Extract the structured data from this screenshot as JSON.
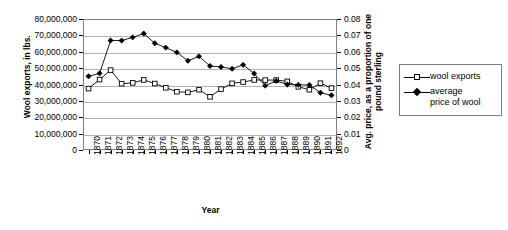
{
  "chart_data": {
    "type": "line",
    "title": "",
    "xlabel": "Year",
    "ylabel": "Wool exports, in lbs.",
    "ylabel_secondary": "Avg. price, as a proportion of one pound sterling",
    "grid": true,
    "legend_position": "right",
    "categories": [
      "1870",
      "1871",
      "1872",
      "1873",
      "1874",
      "1875",
      "1876",
      "1877",
      "1878",
      "1879",
      "1880",
      "1881",
      "1882",
      "1883",
      "1884",
      "1885",
      "1886",
      "1887",
      "1888",
      "1889",
      "1890",
      "1891",
      "1892"
    ],
    "ylim": [
      0,
      80000000
    ],
    "yticks": [
      "0",
      "10,000,000",
      "20,000,000",
      "30,000,000",
      "40,000,000",
      "50,000,000",
      "60,000,000",
      "70,000,000",
      "80,000,000"
    ],
    "ytick_values": [
      0,
      10000000,
      20000000,
      30000000,
      40000000,
      50000000,
      60000000,
      70000000,
      80000000
    ],
    "ylim_secondary": [
      0,
      0.08
    ],
    "yticks_secondary": [
      "0",
      "0.01",
      "0.02",
      "0.03",
      "0.04",
      "0.05",
      "0.06",
      "0.07",
      "0.08"
    ],
    "ytick_values_secondary": [
      0,
      0.01,
      0.02,
      0.03,
      0.04,
      0.05,
      0.06,
      0.07,
      0.08
    ],
    "series": [
      {
        "name": "wool exports",
        "axis": "left",
        "marker": "open-square",
        "color": "#000000",
        "values": [
          37500000,
          43000000,
          48800000,
          40500000,
          41000000,
          42800000,
          40600000,
          38000000,
          35600000,
          35200000,
          36800000,
          32500000,
          37200000,
          40700000,
          41500000,
          42800000,
          42700000,
          42700000,
          41900000,
          38600000,
          36800000,
          40800000,
          37800000
        ]
      },
      {
        "name": "average price of wool",
        "axis": "right",
        "marker": "filled-diamond",
        "color": "#000000",
        "values": [
          0.045,
          0.0468,
          0.0669,
          0.0668,
          0.0688,
          0.0711,
          0.0652,
          0.0625,
          0.0596,
          0.0545,
          0.0572,
          0.0513,
          0.0507,
          0.0496,
          0.052,
          0.0467,
          0.0393,
          0.0422,
          0.04,
          0.0398,
          0.0397,
          0.035,
          0.0334
        ]
      }
    ]
  },
  "legend": {
    "items": [
      {
        "label": "wool exports",
        "marker": "open-square"
      },
      {
        "label": "average price of wool",
        "marker": "filled-diamond",
        "label_line1": "average",
        "label_line2": "price of wool"
      }
    ]
  }
}
